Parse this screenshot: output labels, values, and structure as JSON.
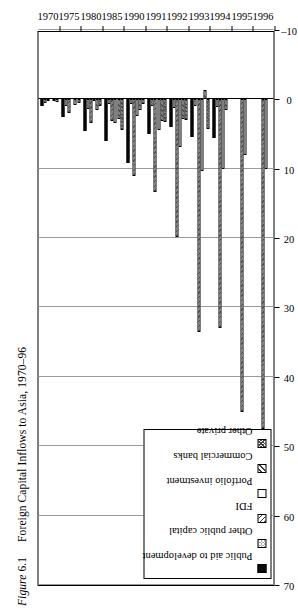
{
  "figure": {
    "label": "Figure",
    "number": "6.1",
    "title": "Foreign Capital Inflows to Asia, 1970–96"
  },
  "legend": {
    "items": [
      {
        "label": "Public aid to development",
        "pattern": "solid-black",
        "color": "#0b0b0b",
        "key": "aid"
      },
      {
        "label": "Other public capital",
        "pattern": "fine-dot",
        "color": "#555555",
        "key": "otherpub"
      },
      {
        "label": "FDI",
        "pattern": "diagonal-hatch-right",
        "color": "#3a3a3a",
        "key": "fdi"
      },
      {
        "label": "Portfolio investment",
        "pattern": "white",
        "color": "#ffffff",
        "key": "portfolio"
      },
      {
        "label": "Commercial banks",
        "pattern": "diagonal-hatch-left",
        "color": "#3a3a3a",
        "key": "banks"
      },
      {
        "label": "Other private",
        "pattern": "cross-hatch",
        "color": "#444444",
        "key": "other"
      }
    ]
  },
  "chart_data": {
    "type": "bar",
    "orientation": "horizontal",
    "title": "Foreign Capital Inflows to Asia, 1970–96",
    "xlabel": "",
    "ylabel": "",
    "value_axis_label": "US$ billion",
    "value_axis_ticks": [
      70,
      60,
      50,
      40,
      30,
      20,
      10,
      0,
      -10
    ],
    "value_axis_range": [
      -10,
      70
    ],
    "grid": true,
    "legend_position": "left",
    "categories": [
      "1970",
      "1975",
      "1980",
      "1985",
      "1990",
      "1991",
      "1992",
      "1993",
      "1994",
      "1995",
      "1996"
    ],
    "series": [
      {
        "name": "Public aid to development",
        "key": "aid",
        "values": [
          0.9,
          2.6,
          4.6,
          6.0,
          9.2,
          5.0,
          4.0,
          5.4,
          5.6,
          0.0,
          0.0
        ]
      },
      {
        "name": "Other public capital",
        "key": "otherpub",
        "values": [
          0.5,
          1.0,
          1.4,
          0.6,
          0.6,
          0.9,
          1.3,
          1.0,
          1.1,
          0.0,
          0.0
        ]
      },
      {
        "name": "FDI",
        "key": "fdi",
        "values": [
          0.3,
          2.0,
          3.4,
          3.1,
          11.0,
          13.4,
          19.8,
          33.5,
          33.0,
          45.0,
          47.5
        ]
      },
      {
        "name": "Portfolio investment",
        "key": "portfolio",
        "values": [
          0.0,
          0.0,
          0.2,
          3.4,
          2.4,
          4.4,
          6.8,
          10.3,
          10.0,
          8.0,
          10.0
        ]
      },
      {
        "name": "Commercial banks",
        "key": "banks",
        "values": [
          0.2,
          0.8,
          1.6,
          2.9,
          1.6,
          3.1,
          2.9,
          -1.4,
          1.6,
          0.0,
          0.0
        ]
      },
      {
        "name": "Other private",
        "key": "other",
        "values": [
          0.4,
          0.5,
          0.9,
          4.4,
          0.7,
          3.3,
          3.0,
          4.2,
          0.0,
          0.0,
          0.0
        ]
      }
    ]
  }
}
